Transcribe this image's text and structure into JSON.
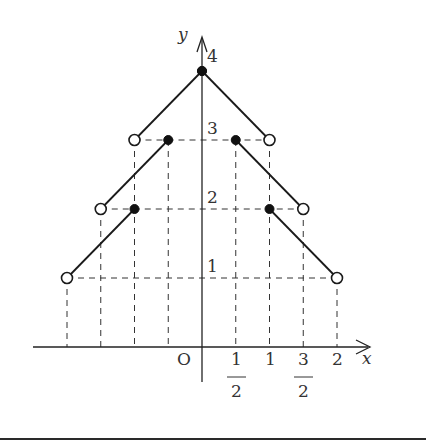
{
  "chart_data": {
    "type": "line",
    "title": "",
    "xlabel": "x",
    "ylabel": "y",
    "origin_label": "O",
    "xlim": [
      -2.4,
      2.5
    ],
    "ylim": [
      -0.5,
      4.5
    ],
    "grid": false,
    "x_ticks": [
      {
        "value": 0.5,
        "label_num": "1",
        "label_den": "2",
        "fraction": true
      },
      {
        "value": 1,
        "label": "1",
        "fraction": false
      },
      {
        "value": 1.5,
        "label_num": "3",
        "label_den": "2",
        "fraction": true
      },
      {
        "value": 2,
        "label": "2",
        "fraction": false
      }
    ],
    "y_ticks": [
      {
        "value": 1,
        "label": "1"
      },
      {
        "value": 2,
        "label": "2"
      },
      {
        "value": 3,
        "label": "3"
      },
      {
        "value": 4,
        "label": "4"
      }
    ],
    "dashed_guides": {
      "horizontal": [
        {
          "y": 1,
          "x_from": -2,
          "x_to": 2
        },
        {
          "y": 2,
          "x_from": -1.5,
          "x_to": 1.5
        },
        {
          "y": 3,
          "x_from": -1,
          "x_to": 1
        }
      ],
      "vertical": [
        {
          "x": -2,
          "y_to": 1
        },
        {
          "x": -1.5,
          "y_to": 2
        },
        {
          "x": -1,
          "y_to": 3
        },
        {
          "x": -0.5,
          "y_to": 3
        },
        {
          "x": 0.5,
          "y_to": 3
        },
        {
          "x": 1,
          "y_to": 3
        },
        {
          "x": 1.5,
          "y_to": 2
        },
        {
          "x": 2,
          "y_to": 1
        }
      ]
    },
    "series": [
      {
        "name": "segment-1",
        "points": [
          {
            "x": -2,
            "y": 1,
            "endpoint": "open"
          },
          {
            "x": -1,
            "y": 2,
            "endpoint": "filled"
          }
        ]
      },
      {
        "name": "segment-2",
        "points": [
          {
            "x": -1.5,
            "y": 2,
            "endpoint": "open"
          },
          {
            "x": -0.5,
            "y": 3,
            "endpoint": "filled"
          }
        ]
      },
      {
        "name": "segment-3",
        "points": [
          {
            "x": -1,
            "y": 3,
            "endpoint": "open"
          },
          {
            "x": 0,
            "y": 4,
            "endpoint": "filled"
          }
        ]
      },
      {
        "name": "segment-4",
        "points": [
          {
            "x": 0,
            "y": 4,
            "endpoint": "filled"
          },
          {
            "x": 1,
            "y": 3,
            "endpoint": "open"
          }
        ]
      },
      {
        "name": "segment-5",
        "points": [
          {
            "x": 0.5,
            "y": 3,
            "endpoint": "filled"
          },
          {
            "x": 1.5,
            "y": 2,
            "endpoint": "open"
          }
        ]
      },
      {
        "name": "segment-6",
        "points": [
          {
            "x": 1,
            "y": 2,
            "endpoint": "filled"
          },
          {
            "x": 2,
            "y": 1,
            "endpoint": "open"
          }
        ]
      }
    ]
  },
  "layout": {
    "origin_px": [
      202,
      347
    ],
    "x_unit_px": 67.5,
    "y_unit_px": 69
  }
}
